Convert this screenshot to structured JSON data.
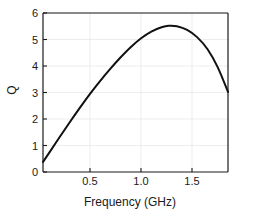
{
  "chart_data": {
    "type": "line",
    "title": "",
    "xlabel": "Frequency (GHz)",
    "ylabel": "Q",
    "xlim": [
      0.04,
      1.85
    ],
    "ylim": [
      0,
      6
    ],
    "xticks": [
      0.5,
      1.0,
      1.5
    ],
    "xticklabels": [
      "0.5",
      "1.0",
      "1.5"
    ],
    "yticks": [
      0,
      1,
      2,
      3,
      4,
      5,
      6
    ],
    "yticklabels": [
      "0",
      "1",
      "2",
      "3",
      "4",
      "5",
      "6"
    ],
    "grid": true,
    "legend": false,
    "line_color": "#111111",
    "line_width": 2,
    "series": [
      {
        "name": "Q",
        "x": [
          0.04,
          0.1,
          0.2,
          0.3,
          0.4,
          0.5,
          0.6,
          0.7,
          0.8,
          0.9,
          1.0,
          1.1,
          1.2,
          1.27,
          1.35,
          1.45,
          1.55,
          1.65,
          1.75,
          1.85
        ],
        "y": [
          0.38,
          0.72,
          1.3,
          1.87,
          2.42,
          2.95,
          3.44,
          3.9,
          4.33,
          4.72,
          5.05,
          5.3,
          5.46,
          5.52,
          5.5,
          5.36,
          5.08,
          4.63,
          3.95,
          3.02
        ]
      }
    ],
    "peak": {
      "x": 1.27,
      "y": 5.52
    },
    "axes_color": "#1a1a1a",
    "grid_color": "#e8e8e8",
    "background": "#ffffff"
  },
  "geometry": {
    "plot_left": 43,
    "plot_right": 228,
    "plot_top": 13,
    "plot_bottom": 172
  }
}
